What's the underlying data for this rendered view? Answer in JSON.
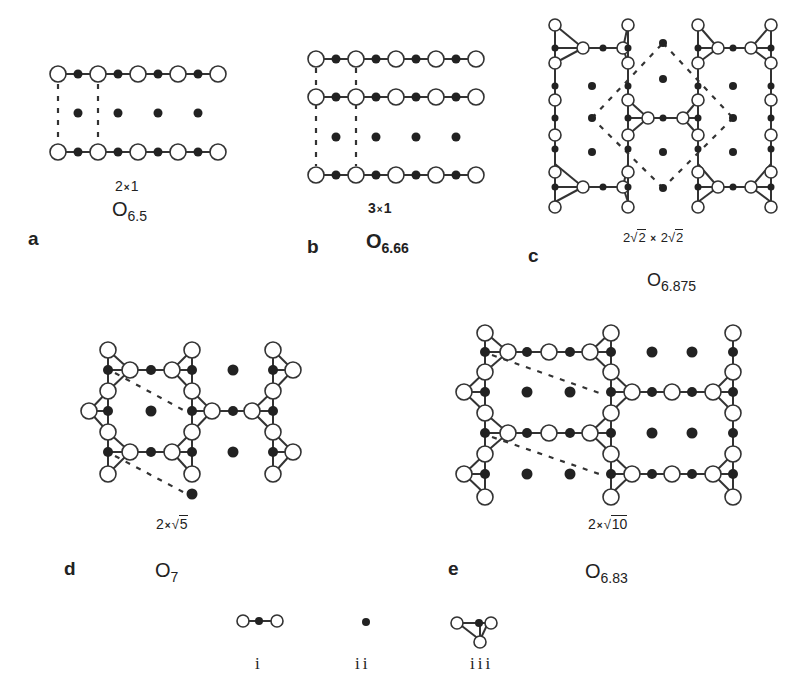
{
  "figure": {
    "colors": {
      "line": "#333333",
      "filled": "#222222",
      "open_fill": "#ffffff",
      "open_stroke": "#333333",
      "text": "#222222"
    }
  },
  "panels": [
    {
      "id": "a",
      "letter": "a",
      "cell_prefix": "2",
      "cell_sep": "×",
      "cell_suffix": "1",
      "cell_radicand": "",
      "ox_base": "O",
      "ox_sub": "6.5"
    },
    {
      "id": "b",
      "letter": "b",
      "cell_prefix": "3",
      "cell_sep": "×",
      "cell_suffix": "1",
      "cell_radicand": "",
      "ox_base": "O",
      "ox_sub": "6.66"
    },
    {
      "id": "c",
      "letter": "c",
      "cell_text": "2√2 × 2√2",
      "cell_prefix": "2",
      "cell_radicand1": "2",
      "cell_sep": "×",
      "cell_prefix2": "2",
      "cell_radicand2": "2",
      "ox_base": "O",
      "ox_sub": "6.875"
    },
    {
      "id": "d",
      "letter": "d",
      "cell_prefix": "2",
      "cell_sep": "×",
      "cell_radicand": "5",
      "ox_base": "O",
      "ox_sub": "7"
    },
    {
      "id": "e",
      "letter": "e",
      "cell_prefix": "2",
      "cell_sep": "×",
      "cell_radicand": "10",
      "ox_base": "O",
      "ox_sub": "6.83"
    }
  ],
  "legend": [
    {
      "id": "i",
      "label": "i",
      "meaning": "bridging O-M-O chain unit"
    },
    {
      "id": "ii",
      "label": "ii",
      "meaning": "isolated metal atom"
    },
    {
      "id": "iii",
      "label": "iii",
      "meaning": "triangular cluster unit"
    }
  ],
  "chart_data": {
    "type": "diagram",
    "panels": [
      {
        "label": "a",
        "cell": "2×1",
        "stoichiometry": "O6.5"
      },
      {
        "label": "b",
        "cell": "3×1",
        "stoichiometry": "O6.66"
      },
      {
        "label": "c",
        "cell": "2√2 × 2√2",
        "stoichiometry": "O6.875"
      },
      {
        "label": "d",
        "cell": "2×√5",
        "stoichiometry": "O7"
      },
      {
        "label": "e",
        "cell": "2×√10",
        "stoichiometry": "O6.83"
      }
    ],
    "legend": [
      "i",
      "ii",
      "iii"
    ]
  }
}
